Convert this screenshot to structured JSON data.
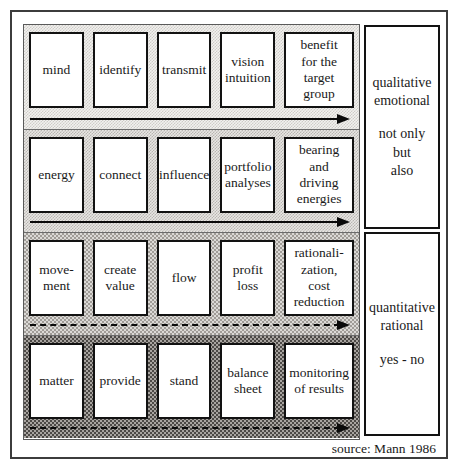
{
  "frame": {
    "rows": [
      {
        "cells": [
          "mind",
          "identify",
          "transmit",
          "vision\nintuition",
          "benefit\nfor the\ntarget\ngroup"
        ]
      },
      {
        "cells": [
          "energy",
          "connect",
          "influence",
          "portfolio\nanalyses",
          "bearing\nand\ndriving\nenergies"
        ]
      },
      {
        "cells": [
          "move-\nment",
          "create\nvalue",
          "flow",
          "profit\nloss",
          "rationali-\nzation,\ncost\nreduction"
        ]
      },
      {
        "cells": [
          "matter",
          "provide",
          "stand",
          "balance\nsheet",
          "monitoring\nof results"
        ]
      }
    ],
    "panels": [
      {
        "top_text": "qualitative\nemotional",
        "bottom_text": "not only\nbut\nalso"
      },
      {
        "top_text": "quantitative\nrational",
        "bottom_text": "yes - no"
      }
    ],
    "source": "source: Mann 1986",
    "colors": {
      "band1": "#f2f1ef",
      "band2": "#e8e6e3",
      "band3": "#dbd9d6",
      "band4": "#a8a4a0",
      "box_border": "#121212",
      "frame_border": "#3c3c3c",
      "text": "#1a1a1a"
    }
  }
}
